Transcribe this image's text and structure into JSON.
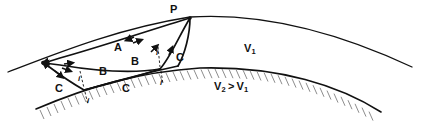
{
  "figure": {
    "type": "ray-path-diagram",
    "source_point_label": "P",
    "media": {
      "upper_label": "V1",
      "upper_label_display": "V",
      "upper_label_sub": "1",
      "lower_label_display": "V",
      "lower_label_sub_first": "2",
      "lower_label_relation": ">",
      "lower_label_sub_second": "1",
      "lower_label_full": "V2 > V1"
    },
    "colors": {
      "stroke": "#111111",
      "hatch": "#9a9a9a",
      "background": "#ffffff"
    },
    "ray_labels": [
      {
        "id": "ray-a",
        "text": "A",
        "x": 114,
        "y": 43,
        "size": "big"
      },
      {
        "id": "ray-b-upper",
        "text": "B",
        "x": 131,
        "y": 57,
        "size": "big"
      },
      {
        "id": "ray-b-lower",
        "text": "B",
        "x": 99,
        "y": 67,
        "size": "big"
      },
      {
        "id": "ray-c-left",
        "text": "C",
        "x": 55,
        "y": 84,
        "size": "big"
      },
      {
        "id": "ray-c-mid",
        "text": "C",
        "x": 122,
        "y": 84,
        "size": "big"
      },
      {
        "id": "ray-c-right",
        "text": "C",
        "x": 176,
        "y": 53,
        "size": "big"
      }
    ],
    "angle_labels": [
      {
        "id": "angle-i-1",
        "text": "i",
        "x": 78,
        "y": 76
      },
      {
        "id": "angle-i-2",
        "text": "i",
        "x": 87,
        "y": 98
      },
      {
        "id": "angle-i-3",
        "text": "i",
        "x": 156,
        "y": 50
      },
      {
        "id": "angle-i-4",
        "text": "i",
        "x": 160,
        "y": 80
      }
    ],
    "velocity_labels": [
      {
        "id": "velocity-upper",
        "x": 244,
        "y": 44
      },
      {
        "id": "velocity-lower",
        "x": 214,
        "y": 82
      }
    ],
    "point_labels": [
      {
        "id": "point-p",
        "text": "P",
        "x": 170,
        "y": 5
      }
    ],
    "geometry": {
      "upper_interface": "M 8,72 C 60,52 120,28 190,17 C 270,12 350,38 412,67",
      "lower_interface": "M 36,109 C 90,86 140,72 200,68 C 280,66 340,86 381,112",
      "source_point": {
        "x": 190,
        "y": 18
      },
      "left_node": {
        "x": 44,
        "y": 63
      },
      "mid_node": {
        "x": 160,
        "y": 69
      },
      "bottom_node": {
        "x": 84,
        "y": 90
      }
    }
  }
}
